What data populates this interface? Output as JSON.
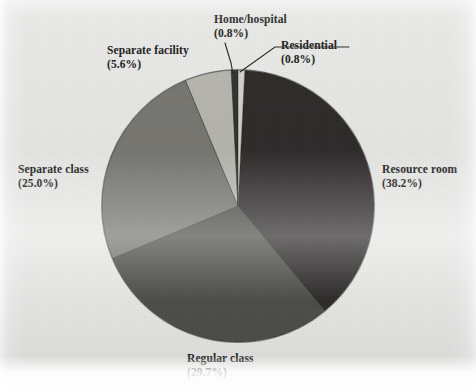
{
  "figure": {
    "caption": "",
    "background_color": "#e8e8e6"
  },
  "chart_data": {
    "type": "pie",
    "title": "",
    "subtitle": "",
    "xlabel": "",
    "ylabel": "",
    "units": "percent",
    "legend_position": "callout-labels",
    "grid": false,
    "start_angle_deg": 0,
    "direction": "clockwise",
    "center": {
      "x": 238,
      "y": 206
    },
    "radius": 136,
    "categories": [
      "Residential",
      "Resource room",
      "Regular class",
      "Separate class",
      "Separate facility",
      "Home/hospital"
    ],
    "values": [
      0.8,
      38.2,
      29.7,
      25.0,
      5.6,
      0.8
    ],
    "slices": [
      {
        "name": "Residential",
        "label": "Residential",
        "percent_text": "(0.8%)",
        "value": 0.8,
        "color": "#d2d2cd",
        "start_deg": 0.0,
        "end_deg": 2.88,
        "label_position": "top-right",
        "has_leader_line": true
      },
      {
        "name": "Resource room",
        "label": "Resource room",
        "percent_text": "(38.2%)",
        "value": 38.2,
        "color": "#2d2c2a",
        "start_deg": 2.88,
        "end_deg": 140.4,
        "label_position": "right",
        "has_leader_line": false
      },
      {
        "name": "Regular class",
        "label": "Regular class",
        "percent_text": "(29.7%)",
        "value": 29.7,
        "color": "#4e4d4a",
        "start_deg": 140.4,
        "end_deg": 247.32,
        "label_position": "bottom",
        "has_leader_line": false
      },
      {
        "name": "Separate class",
        "label": "Separate class",
        "percent_text": "(25.0%)",
        "value": 25.0,
        "color": "#77766f",
        "start_deg": 247.32,
        "end_deg": 337.32,
        "label_position": "left",
        "has_leader_line": false
      },
      {
        "name": "Separate facility",
        "label": "Separate facility",
        "percent_text": "(5.6%)",
        "value": 5.6,
        "color": "#b6b5ae",
        "start_deg": 337.32,
        "end_deg": 357.48,
        "label_position": "top-left",
        "has_leader_line": false
      },
      {
        "name": "Home/hospital",
        "label": "Home/hospital",
        "percent_text": "(0.8%)",
        "value": 0.8,
        "color": "#33322f",
        "start_deg": 357.12,
        "end_deg": 360.0,
        "label_position": "top",
        "has_leader_line": true
      }
    ]
  },
  "labels": {
    "home_hospital": {
      "name": "Home/hospital",
      "percent": "(0.8%)"
    },
    "residential": {
      "name": "Residential",
      "percent": "(0.8%)"
    },
    "separate_facility": {
      "name": "Separate facility",
      "percent": "(5.6%)"
    },
    "separate_class": {
      "name": "Separate class",
      "percent": "(25.0%)"
    },
    "resource_room": {
      "name": "Resource room",
      "percent": "(38.2%)"
    },
    "regular_class": {
      "name": "Regular class",
      "percent": "(29.7%)"
    }
  }
}
